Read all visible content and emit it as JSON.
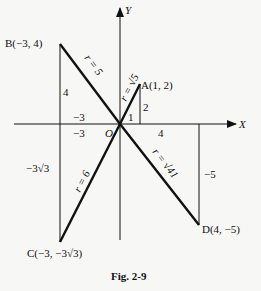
{
  "figure": {
    "caption": "Fig. 2-9",
    "axes": {
      "x_label": "X",
      "y_label": "Y",
      "origin_label": "O"
    },
    "points": [
      {
        "name": "A",
        "label": "A(1, 2)",
        "x": 1,
        "y": 2,
        "r_label": "r = √5",
        "dx_label": "1",
        "dy_label": "2"
      },
      {
        "name": "B",
        "label": "B(−3, 4)",
        "x": -3,
        "y": 4,
        "r_label": "r = 5",
        "dx_label": "−3",
        "dy_label": "4"
      },
      {
        "name": "C",
        "label": "C(−3, −3√3)",
        "x": -3,
        "y": -5.196,
        "r_label": "r = 6",
        "dx_label": "−3",
        "dy_label": "−3√3"
      },
      {
        "name": "D",
        "label": "D(4, −5)",
        "x": 4,
        "y": -5,
        "r_label": "r = √41",
        "dx_label": "4",
        "dy_label": "−5"
      }
    ]
  }
}
